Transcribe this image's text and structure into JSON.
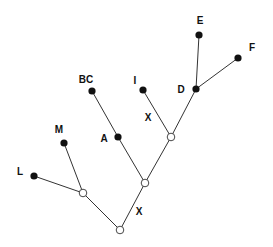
{
  "diagram": {
    "type": "tree",
    "colors": {
      "line": "#333333",
      "filled_node": "#111111",
      "open_node_fill": "#ffffff",
      "background": "#ffffff"
    },
    "nodes": [
      {
        "id": "E",
        "label": "E",
        "kind": "filled",
        "x": 199,
        "y": 35,
        "lx": 200,
        "ly": 24,
        "anchor": "middle"
      },
      {
        "id": "F",
        "label": "F",
        "kind": "filled",
        "x": 238,
        "y": 58,
        "lx": 252,
        "ly": 51,
        "anchor": "middle"
      },
      {
        "id": "D",
        "label": "D",
        "kind": "filled",
        "x": 196,
        "y": 89,
        "lx": 181,
        "ly": 93,
        "anchor": "middle"
      },
      {
        "id": "I",
        "label": "I",
        "kind": "filled",
        "x": 143,
        "y": 90,
        "lx": 135,
        "ly": 84,
        "anchor": "middle"
      },
      {
        "id": "BC",
        "label": "BC",
        "kind": "filled",
        "x": 92,
        "y": 91,
        "lx": 86,
        "ly": 83,
        "anchor": "middle"
      },
      {
        "id": "A",
        "label": "A",
        "kind": "filled",
        "x": 118,
        "y": 137,
        "lx": 104,
        "ly": 142,
        "anchor": "middle"
      },
      {
        "id": "M",
        "label": "M",
        "kind": "filled",
        "x": 64,
        "y": 143,
        "lx": 59,
        "ly": 133,
        "anchor": "middle"
      },
      {
        "id": "L",
        "label": "L",
        "kind": "filled",
        "x": 34,
        "y": 176,
        "lx": 20,
        "ly": 175,
        "anchor": "middle"
      },
      {
        "id": "n1",
        "label": "",
        "kind": "open",
        "x": 171,
        "y": 137
      },
      {
        "id": "n2",
        "label": "",
        "kind": "open",
        "x": 145,
        "y": 183
      },
      {
        "id": "n3",
        "label": "",
        "kind": "open",
        "x": 83,
        "y": 193
      },
      {
        "id": "root",
        "label": "",
        "kind": "open",
        "x": 120,
        "y": 230
      }
    ],
    "edges": [
      [
        "root",
        "n3"
      ],
      [
        "root",
        "n2"
      ],
      [
        "n3",
        "L"
      ],
      [
        "n3",
        "M"
      ],
      [
        "n2",
        "A"
      ],
      [
        "A",
        "BC"
      ],
      [
        "n2",
        "n1"
      ],
      [
        "n1",
        "I"
      ],
      [
        "n1",
        "D"
      ],
      [
        "D",
        "E"
      ],
      [
        "D",
        "F"
      ]
    ],
    "edge_labels": [
      {
        "text": "X",
        "x": 148,
        "y": 121,
        "on_edge": "n1-I"
      },
      {
        "text": "X",
        "x": 139,
        "y": 215,
        "on_edge": "root-n2"
      }
    ]
  }
}
